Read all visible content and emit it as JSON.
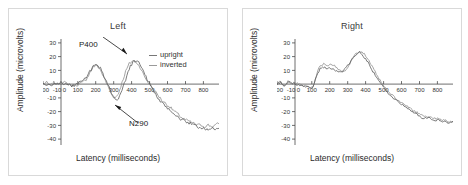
{
  "figure": {
    "background": "#ffffff",
    "border_color": "#d9d9d9"
  },
  "panels": [
    {
      "id": "left",
      "title": "Left",
      "xlabel": "Latency (milliseconds)",
      "ylabel": "Amplitude (microvolts)",
      "legend": {
        "upright": "upright",
        "inverted": "inverted"
      },
      "annotations": [
        {
          "name": "p400",
          "label": "P400"
        },
        {
          "name": "n290",
          "label": "N290"
        }
      ]
    },
    {
      "id": "right",
      "title": "Right",
      "xlabel": "Latency (milliseconds)",
      "ylabel": "Amplitude (microvolts)",
      "legend": {
        "upright": "upright",
        "inverted": "inverted"
      },
      "annotations": []
    }
  ],
  "chart_data": [
    {
      "type": "line",
      "title": "Left",
      "xlabel": "Latency (milliseconds)",
      "ylabel": "Amplitude (microvolts)",
      "xlim": [
        -100,
        880
      ],
      "ylim": [
        -40,
        30
      ],
      "xticks": [
        -100,
        -10,
        0,
        100,
        200,
        300,
        400,
        500,
        600,
        700,
        800
      ],
      "xtick_labels": [
        "-100",
        "-10",
        "0",
        "100",
        "200",
        "300",
        "400",
        "500",
        "600",
        "700",
        "800"
      ],
      "yticks": [
        30,
        20,
        10,
        -10,
        -20,
        -30,
        -40
      ],
      "ytick_labels": [
        "30",
        "20",
        "10",
        "-10",
        "-20",
        "-30",
        "-40"
      ],
      "grid": false,
      "legend_position": "upper right",
      "annotations": [
        {
          "text": "P400",
          "x": 390,
          "y": 15
        },
        {
          "text": "N290",
          "x": 300,
          "y": -11
        }
      ],
      "x": [
        -100,
        -80,
        -60,
        -40,
        -20,
        0,
        20,
        40,
        60,
        80,
        100,
        120,
        140,
        160,
        180,
        200,
        220,
        240,
        260,
        280,
        300,
        320,
        340,
        360,
        380,
        400,
        420,
        440,
        460,
        480,
        500,
        520,
        540,
        560,
        580,
        600,
        620,
        640,
        660,
        680,
        700,
        720,
        740,
        760,
        780,
        800,
        820,
        840,
        860,
        880
      ],
      "series": [
        {
          "name": "upright",
          "color": "#8e8e8e",
          "values": [
            0,
            1,
            -1,
            1,
            0,
            1,
            1,
            0,
            -1,
            -1,
            0,
            1,
            3,
            7,
            11,
            12,
            9,
            4,
            -1,
            -6,
            -9,
            -6,
            1,
            8,
            13,
            15,
            14,
            11,
            6,
            2,
            -1,
            -4,
            -7,
            -10,
            -12,
            -14,
            -16,
            -18,
            -20,
            -22,
            -23,
            -24,
            -25,
            -26,
            -26,
            -27,
            -26,
            -27,
            -26,
            -25
          ]
        },
        {
          "name": "inverted",
          "color": "#5a5a5a",
          "values": [
            0,
            0,
            -1,
            0,
            1,
            1,
            0,
            0,
            -1,
            -1,
            1,
            2,
            4,
            8,
            11,
            12,
            10,
            5,
            0,
            -5,
            -10,
            -9,
            -4,
            3,
            10,
            14,
            15,
            13,
            8,
            3,
            -1,
            -5,
            -9,
            -12,
            -14,
            -16,
            -18,
            -20,
            -22,
            -23,
            -24,
            -25,
            -26,
            -27,
            -28,
            -28,
            -29,
            -28,
            -29,
            -28
          ]
        }
      ]
    },
    {
      "type": "line",
      "title": "Right",
      "xlabel": "Latency (milliseconds)",
      "ylabel": "Amplitude (microvolts)",
      "xlim": [
        -100,
        880
      ],
      "ylim": [
        -40,
        30
      ],
      "xticks": [
        -100,
        -10,
        0,
        100,
        200,
        300,
        400,
        500,
        600,
        700,
        800
      ],
      "xtick_labels": [
        "-100",
        "-10",
        "0",
        "100",
        "200",
        "300",
        "400",
        "500",
        "600",
        "700",
        "800"
      ],
      "yticks": [
        30,
        20,
        10,
        -10,
        -20,
        -30,
        -40
      ],
      "ytick_labels": [
        "30",
        "20",
        "10",
        "-10",
        "-20",
        "-30",
        "-40"
      ],
      "grid": false,
      "legend_position": "upper right",
      "annotations": [],
      "x": [
        -100,
        -80,
        -60,
        -40,
        -20,
        0,
        20,
        40,
        60,
        80,
        100,
        120,
        140,
        160,
        180,
        200,
        220,
        240,
        260,
        280,
        300,
        320,
        340,
        360,
        380,
        400,
        420,
        440,
        460,
        480,
        500,
        520,
        540,
        560,
        580,
        600,
        620,
        640,
        660,
        680,
        700,
        720,
        740,
        760,
        780,
        800,
        820,
        840,
        860,
        880
      ],
      "series": [
        {
          "name": "upright",
          "color": "#8e8e8e",
          "values": [
            0,
            2,
            -2,
            2,
            0,
            1,
            0,
            -1,
            -1,
            -2,
            -2,
            6,
            12,
            13,
            12,
            13,
            12,
            9,
            8,
            9,
            12,
            16,
            20,
            21,
            20,
            17,
            13,
            9,
            5,
            1,
            -2,
            -5,
            -7,
            -9,
            -11,
            -12,
            -14,
            -15,
            -17,
            -18,
            -19,
            -20,
            -21,
            -21,
            -22,
            -22,
            -23,
            -23,
            -24,
            -24
          ]
        },
        {
          "name": "inverted",
          "color": "#5a5a5a",
          "values": [
            0,
            1,
            -1,
            1,
            1,
            0,
            0,
            -1,
            -2,
            -2,
            -2,
            5,
            10,
            11,
            10,
            10,
            9,
            8,
            8,
            10,
            13,
            16,
            19,
            20,
            18,
            15,
            11,
            7,
            3,
            0,
            -3,
            -6,
            -8,
            -10,
            -12,
            -13,
            -15,
            -16,
            -18,
            -19,
            -21,
            -22,
            -21,
            -22,
            -23,
            -23,
            -24,
            -24,
            -25,
            -24
          ]
        }
      ]
    }
  ]
}
